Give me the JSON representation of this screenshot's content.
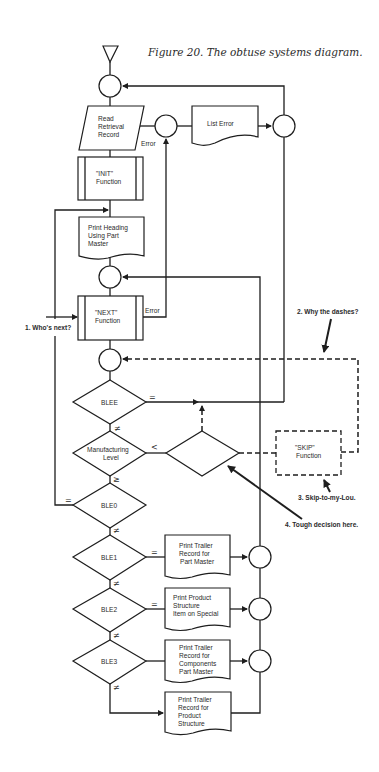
{
  "caption": "Figure 20. The obtuse systems diagram.",
  "nodes": {
    "start": {
      "shape": "triangle"
    },
    "read": {
      "shape": "parallelogram",
      "lines": [
        "Read",
        "Retrieval",
        "Record"
      ]
    },
    "list_error": {
      "shape": "document",
      "lines": [
        "List Error"
      ]
    },
    "init": {
      "shape": "predefined-process",
      "lines": [
        "\"INIT\"",
        "Function"
      ]
    },
    "print_heading": {
      "shape": "document",
      "lines": [
        "Print Heading",
        "Using Part",
        "Master"
      ]
    },
    "next": {
      "shape": "predefined-process",
      "lines": [
        "\"NEXT\"",
        "Function"
      ]
    },
    "blee": {
      "shape": "decision",
      "lines": [
        "BLEE"
      ]
    },
    "mfg": {
      "shape": "decision",
      "lines": [
        "Manufacturing",
        "Level"
      ]
    },
    "unlabeled_decision": {
      "shape": "decision",
      "lines": []
    },
    "skip": {
      "shape": "predefined-process-dashed",
      "lines": [
        "\"SKIP\"",
        "Function"
      ]
    },
    "ble0": {
      "shape": "decision",
      "lines": [
        "BLE0"
      ]
    },
    "ble1": {
      "shape": "decision",
      "lines": [
        "BLE1"
      ]
    },
    "ble2": {
      "shape": "decision",
      "lines": [
        "BLE2"
      ]
    },
    "ble3": {
      "shape": "decision",
      "lines": [
        "BLE3"
      ]
    },
    "trailer_part": {
      "shape": "document",
      "lines": [
        "Print Trailer",
        "Record for",
        "Part Master"
      ]
    },
    "product_special": {
      "shape": "document",
      "lines": [
        "Print Product",
        "Structure",
        "Item on Special"
      ]
    },
    "trailer_components": {
      "shape": "document",
      "lines": [
        "Print Trailer",
        "Record for",
        "Components",
        "Part Master"
      ]
    },
    "trailer_product": {
      "shape": "document",
      "lines": [
        "Print Trailer",
        "Record for",
        "Product",
        "Structure"
      ]
    }
  },
  "edge_labels": {
    "read_error": "Error",
    "next_error": "Error",
    "blee_eq": "=",
    "blee_ne": "≠",
    "mfg_lt": "<",
    "mfg_ge": "≥",
    "ble0_eq": "=",
    "ble0_ne": "≠",
    "ble1_eq": "=",
    "ble1_ne": "≠",
    "ble2_eq": "=",
    "ble2_ne": "≠",
    "ble3_ne": "≠"
  },
  "annotations": [
    {
      "id": 1,
      "text": "1.  Who's next?"
    },
    {
      "id": 2,
      "text": "2.  Why the dashes?"
    },
    {
      "id": 3,
      "text": "3.  Skip-to-my-Lou."
    },
    {
      "id": 4,
      "text": "4.  Tough decision here."
    }
  ],
  "colors": {
    "ink": "#1e1e1e",
    "paper": "#ffffff"
  }
}
